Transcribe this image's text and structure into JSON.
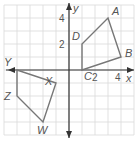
{
  "chart_data": {
    "type": "coordinate-plane",
    "xlabel": "x",
    "ylabel": "y",
    "xlim": [
      -5,
      5
    ],
    "ylim": [
      -5,
      5
    ],
    "grid": true,
    "x_tick_labels": [
      "2",
      "4"
    ],
    "y_tick_labels": [
      "2",
      "4"
    ],
    "polygons": [
      {
        "name": "ABCD",
        "vertices": [
          {
            "label": "A",
            "x": 3,
            "y": 4
          },
          {
            "label": "B",
            "x": 4,
            "y": 1
          },
          {
            "label": "C",
            "x": 1,
            "y": 0
          },
          {
            "label": "D",
            "x": 1,
            "y": 2
          }
        ]
      },
      {
        "name": "WXYZ",
        "vertices": [
          {
            "label": "X",
            "x": -1,
            "y": -1
          },
          {
            "label": "Y",
            "x": -4,
            "y": 0
          },
          {
            "label": "Z",
            "x": -4,
            "y": -2
          },
          {
            "label": "W",
            "x": -2,
            "y": -4
          }
        ]
      }
    ]
  },
  "colors": {
    "grid": "#d9d9d9",
    "axis": "#333333",
    "polygon": "#777777",
    "label": "#555555"
  }
}
